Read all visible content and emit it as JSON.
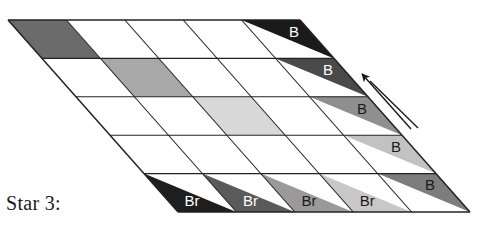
{
  "figure": {
    "caption": "Star 3:",
    "type": "sheared-grid-diagram",
    "grid": {
      "rows": 5,
      "cols": 5,
      "corners": {
        "top_left": [
          8,
          20
        ],
        "top_right": [
          300,
          20
        ],
        "bottom_right": [
          470,
          212
        ],
        "bottom_left": [
          178,
          212
        ]
      },
      "row_shift_x": 34,
      "col_width": 58.4,
      "row_height": 38.4,
      "line_color": "#222222",
      "background": "#ffffff"
    },
    "cells": [
      {
        "row": 0,
        "col": 0,
        "fill": "#6b6b6b",
        "label": ""
      },
      {
        "row": 0,
        "col": 1,
        "fill": "#ffffff",
        "label": ""
      },
      {
        "row": 0,
        "col": 2,
        "fill": "#ffffff",
        "label": ""
      },
      {
        "row": 0,
        "col": 3,
        "fill": "#ffffff",
        "label": ""
      },
      {
        "row": 0,
        "col": 4,
        "fill": "#ffffff",
        "label": ""
      },
      {
        "row": 1,
        "col": 0,
        "fill": "#ffffff",
        "label": ""
      },
      {
        "row": 1,
        "col": 1,
        "fill": "#a8a8a8",
        "label": ""
      },
      {
        "row": 1,
        "col": 2,
        "fill": "#ffffff",
        "label": ""
      },
      {
        "row": 1,
        "col": 3,
        "fill": "#ffffff",
        "label": ""
      },
      {
        "row": 1,
        "col": 4,
        "fill": "#ffffff",
        "label": ""
      },
      {
        "row": 2,
        "col": 0,
        "fill": "#ffffff",
        "label": ""
      },
      {
        "row": 2,
        "col": 1,
        "fill": "#ffffff",
        "label": ""
      },
      {
        "row": 2,
        "col": 2,
        "fill": "#d8d8d8",
        "label": ""
      },
      {
        "row": 2,
        "col": 3,
        "fill": "#ffffff",
        "label": ""
      },
      {
        "row": 2,
        "col": 4,
        "fill": "#ffffff",
        "label": ""
      },
      {
        "row": 3,
        "col": 0,
        "fill": "#ffffff",
        "label": ""
      },
      {
        "row": 3,
        "col": 1,
        "fill": "#ffffff",
        "label": ""
      },
      {
        "row": 3,
        "col": 2,
        "fill": "#ffffff",
        "label": ""
      },
      {
        "row": 3,
        "col": 3,
        "fill": "#ffffff",
        "label": ""
      },
      {
        "row": 3,
        "col": 4,
        "fill": "#ffffff",
        "label": ""
      },
      {
        "row": 4,
        "col": 0,
        "fill": "#ffffff",
        "label": ""
      },
      {
        "row": 4,
        "col": 1,
        "fill": "#ffffff",
        "label": ""
      },
      {
        "row": 4,
        "col": 2,
        "fill": "#ffffff",
        "label": ""
      },
      {
        "row": 4,
        "col": 3,
        "fill": "#ffffff",
        "label": ""
      },
      {
        "row": 4,
        "col": 4,
        "fill": "#ffffff",
        "label": ""
      }
    ],
    "right_edge_triangles": [
      {
        "index": 0,
        "row": 0,
        "label": "B",
        "fill": "#1a1a1a",
        "text_color": "#ffffff"
      },
      {
        "index": 1,
        "row": 1,
        "label": "B",
        "fill": "#4a4a4a",
        "text_color": "#ffffff"
      },
      {
        "index": 2,
        "row": 2,
        "label": "B",
        "fill": "#8f8f8f",
        "text_color": "#1a1a1a"
      },
      {
        "index": 3,
        "row": 3,
        "label": "B",
        "fill": "#c2c2c2",
        "text_color": "#1a1a1a"
      },
      {
        "index": 4,
        "row": 4,
        "label": "B",
        "fill": "#7d7d7d",
        "text_color": "#1a1a1a"
      }
    ],
    "bottom_edge_triangles": [
      {
        "index": 0,
        "col": 0,
        "label": "Br",
        "fill": "#1e1e1e",
        "text_color": "#ffffff"
      },
      {
        "index": 1,
        "col": 1,
        "label": "Br",
        "fill": "#5a5a5a",
        "text_color": "#ffffff"
      },
      {
        "index": 2,
        "col": 2,
        "label": "Br",
        "fill": "#9a9a9a",
        "text_color": "#1a1a1a"
      },
      {
        "index": 3,
        "col": 3,
        "label": "Br",
        "fill": "#c8c8c8",
        "text_color": "#1a1a1a"
      }
    ],
    "arrow": {
      "name": "direction-arrow",
      "from": [
        411,
        129
      ],
      "to": [
        362,
        74
      ],
      "color": "#1a1a1a",
      "direction": "up-left"
    }
  }
}
